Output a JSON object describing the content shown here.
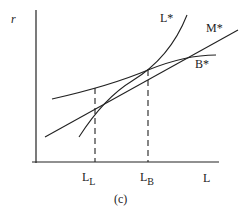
{
  "figure": {
    "caption": "(c)",
    "y_axis_label": "r",
    "x_axis_label": "L",
    "curves": [
      {
        "id": "L_star",
        "label": "L*",
        "shape": "convex increasing"
      },
      {
        "id": "M_star",
        "label": "M*",
        "shape": "straight line increasing"
      },
      {
        "id": "B_star",
        "label": "B*",
        "shape": "concave increasing"
      }
    ],
    "markers": [
      {
        "id": "L_L",
        "main": "L",
        "sub": "L",
        "style": "dashed vertical"
      },
      {
        "id": "L_B",
        "main": "L",
        "sub": "B",
        "style": "dashed vertical"
      }
    ],
    "colors": {
      "stroke": "#222222",
      "background": "#ffffff"
    }
  }
}
